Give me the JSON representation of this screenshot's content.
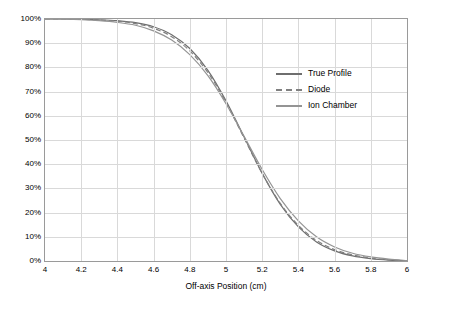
{
  "chart_data": {
    "type": "line",
    "title": "",
    "xlabel": "Off-axis Position (cm)",
    "ylabel": "",
    "xlim": [
      4,
      6
    ],
    "ylim": [
      0,
      1
    ],
    "grid": true,
    "legend_position": "inside-right",
    "xticks": [
      "4",
      "4.2",
      "4.4",
      "4.6",
      "4.8",
      "5",
      "5.2",
      "5.4",
      "5.6",
      "5.8",
      "6"
    ],
    "xtick_values": [
      4,
      4.2,
      4.4,
      4.6,
      4.8,
      5,
      5.2,
      5.4,
      5.6,
      5.8,
      6
    ],
    "yticks": [
      "0%",
      "10%",
      "20%",
      "30%",
      "40%",
      "50%",
      "60%",
      "70%",
      "80%",
      "90%",
      "100%"
    ],
    "ytick_values": [
      0,
      0.1,
      0.2,
      0.3,
      0.4,
      0.5,
      0.6,
      0.7,
      0.8,
      0.9,
      1
    ],
    "x": [
      4.0,
      4.1,
      4.2,
      4.3,
      4.4,
      4.5,
      4.6,
      4.7,
      4.8,
      4.9,
      5.0,
      5.1,
      5.2,
      5.3,
      5.4,
      5.5,
      5.6,
      5.7,
      5.8,
      5.9,
      6.0
    ],
    "series": [
      {
        "name": "True Profile",
        "color": "#6e6e6e",
        "style": "solid",
        "values": [
          1.0,
          1.0,
          0.999,
          0.997,
          0.993,
          0.985,
          0.968,
          0.935,
          0.878,
          0.788,
          0.662,
          0.512,
          0.362,
          0.234,
          0.141,
          0.079,
          0.042,
          0.021,
          0.01,
          0.004,
          0.001
        ]
      },
      {
        "name": "Diode",
        "color": "#808080",
        "style": "dashed",
        "values": [
          1.0,
          1.0,
          0.999,
          0.996,
          0.991,
          0.981,
          0.962,
          0.927,
          0.868,
          0.779,
          0.655,
          0.508,
          0.362,
          0.238,
          0.147,
          0.085,
          0.047,
          0.025,
          0.012,
          0.005,
          0.001
        ]
      },
      {
        "name": "Ion Chamber",
        "color": "#949494",
        "style": "solid",
        "values": [
          1.0,
          0.999,
          0.997,
          0.993,
          0.986,
          0.974,
          0.951,
          0.913,
          0.853,
          0.766,
          0.65,
          0.515,
          0.378,
          0.258,
          0.166,
          0.1,
          0.058,
          0.032,
          0.017,
          0.008,
          0.002
        ]
      }
    ]
  },
  "legend": {
    "items": [
      {
        "label": "True Profile"
      },
      {
        "label": "Diode"
      },
      {
        "label": "Ion Chamber"
      }
    ]
  }
}
